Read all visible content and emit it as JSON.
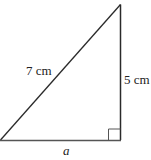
{
  "diagram": {
    "type": "right-triangle",
    "hypotenuse_label": "7 cm",
    "vertical_leg_label": "5 cm",
    "horizontal_leg_label": "a",
    "right_angle_marker": true,
    "stroke_color": "#2a2a2a",
    "background_color": "#ffffff"
  }
}
